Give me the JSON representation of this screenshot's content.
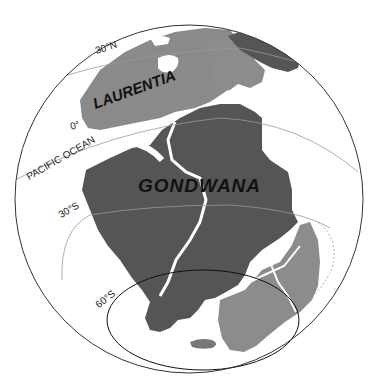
{
  "map": {
    "projection": "orthographic globe",
    "colors": {
      "background": "#ffffff",
      "ocean": "#ffffff",
      "gondwana_fill": "#555555",
      "laurentia_fill": "#8a8a8a",
      "terrane_fill": "#8c8c8c",
      "globe_outline": "#333333",
      "latitude_line": "#999999",
      "highlight_circle": "#111111"
    },
    "labels": {
      "laurentia": "LAURENTIA",
      "gondwana": "GONDWANA",
      "ocean": "PACIFIC OCEAN",
      "lat_30n": "30°N",
      "lat_0": "0°",
      "lat_30s": "30°S",
      "lat_60s": "60°S"
    },
    "latitude_lines": [
      "30°N",
      "0°",
      "30°S",
      "60°S"
    ],
    "landmasses": [
      "Laurentia",
      "Gondwana",
      "Baltica-Siberia region (dark, top right)",
      "Antarctica/Australia region (lighter, bottom right)"
    ]
  }
}
